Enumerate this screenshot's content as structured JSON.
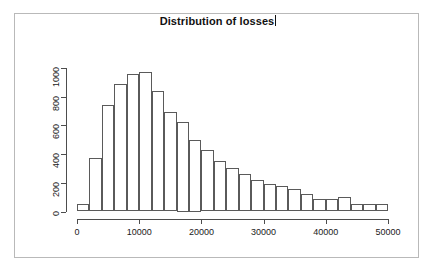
{
  "chart_data": {
    "type": "bar",
    "title": "Distribution of losses",
    "subtitle": "",
    "xlabel": "",
    "ylabel": "",
    "xlim": [
      0,
      50000
    ],
    "ylim": [
      0,
      1000
    ],
    "grid": false,
    "legend": false,
    "bin_width": 2000,
    "x_tick_labels": [
      "0",
      "10000",
      "20000",
      "30000",
      "40000",
      "50000"
    ],
    "x_tick_values": [
      0,
      10000,
      20000,
      30000,
      40000,
      50000
    ],
    "y_tick_labels": [
      "0",
      "200",
      "400",
      "600",
      "800",
      "1000"
    ],
    "y_tick_values": [
      0,
      200,
      400,
      600,
      800,
      1000
    ],
    "categories": [
      "0-2000",
      "2000-4000",
      "4000-6000",
      "6000-8000",
      "8000-10000",
      "10000-12000",
      "12000-14000",
      "14000-16000",
      "16000-18000",
      "18000-20000",
      "20000-22000",
      "22000-24000",
      "24000-26000",
      "26000-28000",
      "28000-30000",
      "30000-32000",
      "32000-34000",
      "34000-36000",
      "36000-38000",
      "38000-40000",
      "40000-42000",
      "42000-44000",
      "44000-46000",
      "46000-48000",
      "48000-50000"
    ],
    "bin_starts": [
      0,
      2000,
      4000,
      6000,
      8000,
      10000,
      12000,
      14000,
      16000,
      18000,
      20000,
      22000,
      24000,
      26000,
      28000,
      30000,
      32000,
      34000,
      36000,
      38000,
      40000,
      42000,
      44000,
      46000,
      48000
    ],
    "values": [
      50,
      370,
      745,
      890,
      960,
      970,
      840,
      690,
      625,
      500,
      430,
      350,
      300,
      260,
      220,
      190,
      175,
      155,
      120,
      85,
      85,
      100,
      55,
      55,
      55
    ]
  },
  "titlebar": {
    "title_text": "Distribution of losses",
    "caret_visible": true
  },
  "colors": {
    "background": "#ffffff",
    "frame": "#b9b9b9",
    "axis": "#4d4d4d",
    "bar_stroke": "#5a5a5a",
    "bar_fill": "#ffffff",
    "text": "#1a1a1a",
    "title": "#111111"
  }
}
